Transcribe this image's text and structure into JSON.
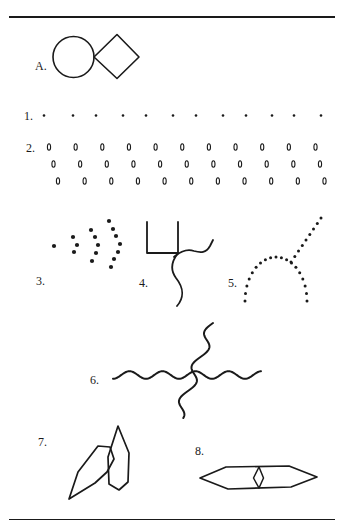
{
  "colors": {
    "ink": "#1a1a1a",
    "background": "#ffffff"
  },
  "figures": [
    {
      "id": "A",
      "label": "A.",
      "description": "Circle touching a diamond (square rotated 45°)"
    },
    {
      "id": "1",
      "label": "1.",
      "description": "Horizontal row of 12 dots, paired spacing"
    },
    {
      "id": "2",
      "label": "2.",
      "description": "Three rows of 11 small ovals, each row shifted right, forming slanted columns"
    },
    {
      "id": "3",
      "label": "3.",
      "description": "Dots forming a single point followed by arrowhead arcs of 3, 5 and 7 dots"
    },
    {
      "id": "4",
      "label": "4.",
      "description": "Open square with an S-shaped bell curve touching its lower-right corner"
    },
    {
      "id": "5",
      "label": "5.",
      "description": "Dotted arch with a dotted diagonal line extending to the upper right"
    },
    {
      "id": "6",
      "label": "6.",
      "description": "Two crossing sinusoidal lines, one horizontal and one vertical"
    },
    {
      "id": "7",
      "label": "7.",
      "description": "Two overlapping elongated hexagons, one tilted"
    },
    {
      "id": "8",
      "label": "8.",
      "description": "Elongated horizontal hexagon with a small diamond inside at its center"
    }
  ],
  "counts": {
    "figure1_dots": 12,
    "figure2_rows": 3,
    "figure2_ovals_per_row": 11,
    "figure3_dot_groups": [
      1,
      3,
      5,
      7
    ]
  }
}
